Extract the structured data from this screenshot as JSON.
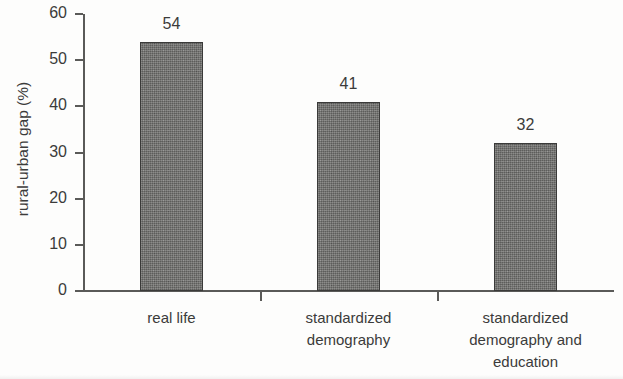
{
  "chart_data": {
    "type": "bar",
    "title": "",
    "subtitle": "",
    "xlabel": "",
    "ylabel": "rural-urban gap (%)",
    "categories": [
      "real life",
      "standardized demography",
      "standardized demography and education"
    ],
    "category_lines": [
      [
        "real life"
      ],
      [
        "standardized",
        "demography"
      ],
      [
        "standardized",
        "demography and",
        "education"
      ]
    ],
    "values": [
      54,
      41,
      32
    ],
    "value_labels": [
      "54",
      "41",
      "32"
    ],
    "ylim": [
      0,
      60
    ],
    "yticks": [
      0,
      10,
      20,
      30,
      40,
      50,
      60
    ],
    "ytick_labels": [
      "0",
      "10",
      "20",
      "30",
      "40",
      "50",
      "60"
    ],
    "grid": false,
    "legend": false,
    "legend_position": "none",
    "bar_color": "#6f6f6d",
    "bar_edge_color": "#3a3a39",
    "axis_color": "#5a5a58",
    "text_color": "#3b3b3a",
    "background_color": "#fdfdfc"
  }
}
